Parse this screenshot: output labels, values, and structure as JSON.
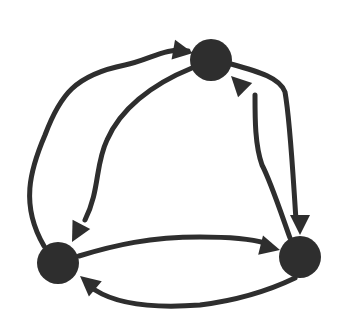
{
  "diagram": {
    "type": "directed-graph",
    "colors": {
      "background": "#ffffff",
      "ink": "#2e2e2e"
    },
    "stroke_width": 5,
    "nodes": [
      {
        "id": "top",
        "cx": 211,
        "cy": 60,
        "r": 21
      },
      {
        "id": "right",
        "cx": 300,
        "cy": 257,
        "r": 21
      },
      {
        "id": "left",
        "cx": 58,
        "cy": 263,
        "r": 21
      }
    ],
    "edges": [
      {
        "id": "left-to-top-outer",
        "from": "left",
        "to": "top",
        "path": "M 44 246 C 20 205, 30 170, 45 135 C 60 95, 75 75, 125 65 C 150 60, 165 47, 188 51",
        "arrow": {
          "tip": [
            193,
            53
          ],
          "angle": 10
        }
      },
      {
        "id": "top-to-left-inner",
        "from": "top",
        "to": "left",
        "path": "M 192 68 C 150 85, 120 110, 107 140 C 95 165, 100 190, 85 220",
        "arrow": {
          "tip": [
            72,
            242
          ],
          "angle": 118
        }
      },
      {
        "id": "top-to-right-outer",
        "from": "top",
        "to": "right",
        "path": "M 231 64 C 260 72, 280 78, 285 92 C 290 120, 292 160, 296 220",
        "arrow": {
          "tip": [
            300,
            235
          ],
          "angle": 90
        }
      },
      {
        "id": "right-to-top-inner",
        "from": "right",
        "to": "top",
        "path": "M 290 238 C 280 210, 270 180, 262 165 C 255 145, 255 120, 255 95",
        "arrow": {
          "tip": [
            231,
            76
          ],
          "angle": -135
        }
      },
      {
        "id": "left-to-right-upper",
        "from": "left",
        "to": "right",
        "path": "M 79 256 C 115 245, 150 237, 200 237 C 240 237, 255 240, 265 243",
        "arrow": {
          "tip": [
            280,
            250
          ],
          "angle": 14
        }
      },
      {
        "id": "right-to-left-lower",
        "from": "right",
        "to": "left",
        "path": "M 295 278 C 270 290, 240 300, 200 305 C 160 308, 120 306, 95 290",
        "arrow": {
          "tip": [
            80,
            276
          ],
          "angle": -140
        }
      }
    ]
  }
}
